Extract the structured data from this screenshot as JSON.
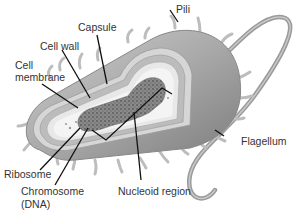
{
  "diagram": {
    "colors": {
      "body_fill": "#a8a8a8",
      "body_shade": "#8a8a8a",
      "capsule": "#d4d4d4",
      "wall": "#bcbcbc",
      "membrane": "#e6e6e6",
      "cytoplasm": "#f2f2f2",
      "dna": "#7a7a7a",
      "pili": "#dcdcdc",
      "flagellum": "#9a9a9a",
      "leader_line": "#111111",
      "label_text": "#333333"
    },
    "labels": {
      "pili": "Pili",
      "capsule": "Capsule",
      "cell_wall": "Cell wall",
      "cell_membrane_line1": "Cell",
      "cell_membrane_line2": "membrane",
      "flagellum": "Flagellum",
      "ribosome": "Ribosome",
      "chromosome_line1": "Chromosome",
      "chromosome_line2": "(DNA)",
      "nucleoid_region": "Nucleoid region"
    }
  }
}
